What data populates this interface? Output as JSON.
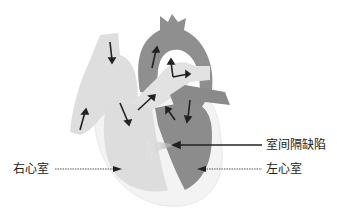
{
  "diagram": {
    "labels": {
      "vsd": "室间隔缺陷",
      "right_ventricle": "右心室",
      "left_ventricle": "左心室"
    },
    "colors": {
      "right_side": "#dcdcdc",
      "left_side": "#8c8c8c",
      "outline": "#f4f4f4",
      "arrow": "#222222"
    }
  }
}
